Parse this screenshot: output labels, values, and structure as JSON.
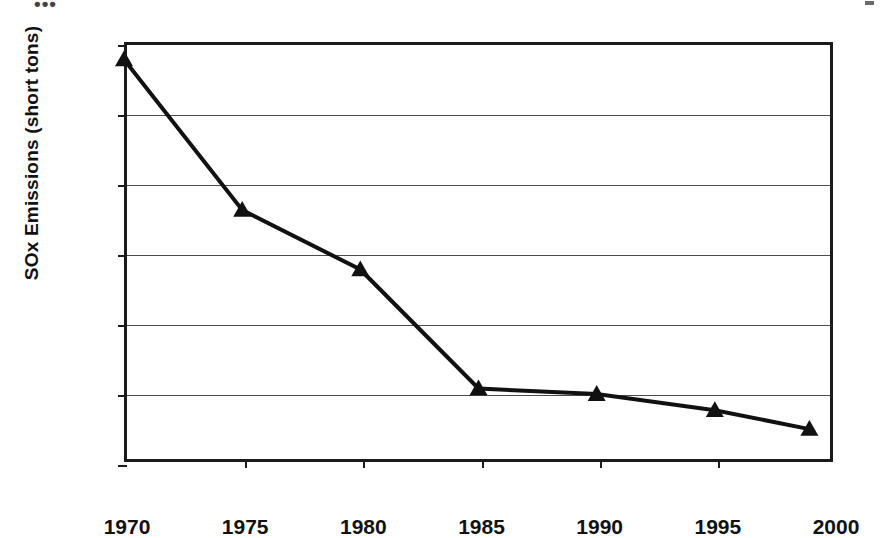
{
  "artifacts": {
    "top_left_fragment": "•••",
    "top_right_fragment": ""
  },
  "chart_data": {
    "type": "line",
    "title": "",
    "xlabel": "",
    "ylabel": "SOx Emissions (short tons)",
    "x": [
      1970,
      1975,
      1980,
      1985,
      1990,
      1995,
      1999
    ],
    "values": [
      7750,
      5600,
      4750,
      3050,
      2970,
      2740,
      2470
    ],
    "series": [
      {
        "name": "SOx Emissions",
        "values": [
          7750,
          5600,
          4750,
          3050,
          2970,
          2740,
          2470
        ]
      }
    ],
    "xlim": [
      1970,
      2000
    ],
    "ylim": [
      2000,
      8000
    ],
    "xticks": [
      1970,
      1975,
      1980,
      1985,
      1990,
      1995,
      2000
    ],
    "xticklabels": [
      "1970",
      "1975",
      "1980",
      "1985",
      "1990",
      "1995",
      "2000"
    ],
    "yticks": [
      2000,
      3000,
      4000,
      5000,
      6000,
      7000,
      8000
    ],
    "yticklabels": [
      "2000",
      "3000",
      "4000",
      "5000",
      "6000",
      "7000",
      "8000"
    ],
    "grid": "horizontal",
    "legend": "none",
    "marker": "triangle",
    "line_color": "#111111",
    "marker_color": "#111111"
  }
}
